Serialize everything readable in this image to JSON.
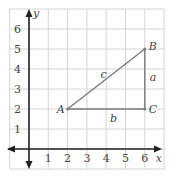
{
  "diagram": {
    "type": "coordinate-plane-triangle",
    "axes": {
      "x_label": "x",
      "y_label": "y",
      "x_ticks": [
        "1",
        "2",
        "3",
        "4",
        "5",
        "6"
      ],
      "y_ticks": [
        "1",
        "2",
        "3",
        "4",
        "5",
        "6"
      ],
      "grid_range": {
        "x": [
          -1,
          7
        ],
        "y": [
          -1,
          7
        ]
      }
    },
    "points": [
      {
        "name": "A",
        "x": 2,
        "y": 2
      },
      {
        "name": "B",
        "x": 6,
        "y": 5
      },
      {
        "name": "C",
        "x": 6,
        "y": 2
      }
    ],
    "sides": [
      {
        "name": "c",
        "from": "A",
        "to": "B"
      },
      {
        "name": "a",
        "from": "B",
        "to": "C"
      },
      {
        "name": "b",
        "from": "A",
        "to": "C"
      }
    ],
    "colors": {
      "grid": "#d4d4d4",
      "axis": "#222222",
      "triangle": "#7a7a7a",
      "text": "#444444"
    }
  }
}
